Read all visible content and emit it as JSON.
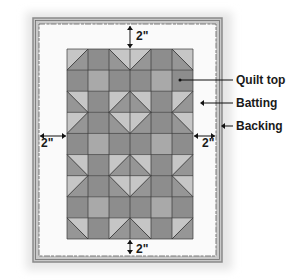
{
  "diagram": {
    "type": "quilt-layers",
    "colors": {
      "backing_border": "#8a8a8a",
      "backing_fill": "#c9c9c9",
      "batting_fill": "#fafafa",
      "dark": "#8d8d8d",
      "medium": "#a9a9a9",
      "light": "#c6c6c6",
      "grid_line": "#3a3a3a"
    },
    "geometry": {
      "backing": {
        "x": 33,
        "y": 18,
        "w": 189,
        "h": 244
      },
      "batting": {
        "x": 39,
        "y": 24,
        "w": 177,
        "h": 232
      },
      "quilt_top": {
        "x": 67,
        "y": 49,
        "w": 126,
        "h": 190,
        "cols": 6,
        "rows": 9
      }
    },
    "labels": {
      "quilt_top": "Quilt top",
      "batting": "Batting",
      "backing": "Backing"
    },
    "dimensions": {
      "top": "2\"",
      "left": "2\"",
      "right": "2\"",
      "bottom": "2\""
    },
    "grid_cells": [
      [
        "L",
        "D",
        "L",
        "L",
        "D",
        "L"
      ],
      [
        "D",
        "M",
        "D",
        "D",
        "M",
        "D"
      ],
      [
        "L",
        "D",
        "L",
        "L",
        "D",
        "L"
      ],
      [
        "L",
        "D",
        "L",
        "L",
        "D",
        "L"
      ],
      [
        "D",
        "M",
        "D",
        "D",
        "M",
        "D"
      ],
      [
        "L",
        "D",
        "L",
        "L",
        "D",
        "L"
      ],
      [
        "L",
        "D",
        "L",
        "L",
        "D",
        "L"
      ],
      [
        "D",
        "M",
        "D",
        "D",
        "M",
        "D"
      ],
      [
        "L",
        "D",
        "L",
        "L",
        "D",
        "L"
      ]
    ],
    "diagonals": [
      [
        0,
        0,
        "/"
      ],
      [
        0,
        2,
        "\\"
      ],
      [
        0,
        3,
        "/"
      ],
      [
        0,
        5,
        "\\"
      ],
      [
        2,
        0,
        "\\"
      ],
      [
        3,
        0,
        "/"
      ],
      [
        2,
        2,
        "/"
      ],
      [
        2,
        3,
        "\\"
      ],
      [
        3,
        2,
        "\\"
      ],
      [
        3,
        3,
        "/"
      ],
      [
        2,
        5,
        "/"
      ],
      [
        3,
        5,
        "\\"
      ],
      [
        5,
        0,
        "\\"
      ],
      [
        6,
        0,
        "/"
      ],
      [
        5,
        2,
        "/"
      ],
      [
        5,
        3,
        "\\"
      ],
      [
        6,
        2,
        "\\"
      ],
      [
        6,
        3,
        "/"
      ],
      [
        5,
        5,
        "/"
      ],
      [
        6,
        5,
        "\\"
      ],
      [
        8,
        0,
        "\\"
      ],
      [
        8,
        2,
        "/"
      ],
      [
        8,
        3,
        "\\"
      ],
      [
        8,
        5,
        "/"
      ]
    ]
  }
}
